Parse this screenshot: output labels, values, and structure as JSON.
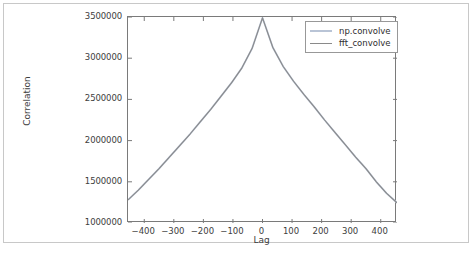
{
  "figure": {
    "background_color": "#ffffff",
    "frame_color": "#c8c8c8",
    "axes_edge_color": "#7a7a7a"
  },
  "legend": {
    "position": "upper right",
    "entries": [
      {
        "label": "np.convolve",
        "color": "#b9c4d6"
      },
      {
        "label": "fft_convolve",
        "color": "#8a8a8a"
      }
    ]
  },
  "chart_data": {
    "type": "line",
    "title": "",
    "xlabel": "Lag",
    "ylabel": "Correlation",
    "xlim": [
      -455,
      455
    ],
    "ylim": [
      1000000,
      3500000
    ],
    "grid": false,
    "legend_position": "upper right",
    "xticks": [
      -400,
      -300,
      -200,
      -100,
      0,
      100,
      200,
      300,
      400
    ],
    "xtick_labels": [
      "−400",
      "−300",
      "−200",
      "−100",
      "0",
      "100",
      "200",
      "300",
      "400"
    ],
    "yticks": [
      1000000,
      1500000,
      2000000,
      2500000,
      3000000,
      3500000
    ],
    "ytick_labels": [
      "1000000",
      "1500000",
      "2000000",
      "2500000",
      "3000000",
      "3500000"
    ],
    "x": [
      -455,
      -420,
      -385,
      -350,
      -315,
      -280,
      -245,
      -210,
      -175,
      -140,
      -105,
      -70,
      -35,
      0,
      35,
      70,
      105,
      140,
      175,
      210,
      245,
      280,
      315,
      350,
      385,
      420,
      455
    ],
    "series": [
      {
        "name": "np.convolve",
        "color": "#b9c4d6",
        "values": [
          1280000,
          1400000,
          1530000,
          1660000,
          1800000,
          1940000,
          2080000,
          2230000,
          2380000,
          2540000,
          2700000,
          2880000,
          3120000,
          3490000,
          3130000,
          2900000,
          2720000,
          2560000,
          2410000,
          2250000,
          2100000,
          1950000,
          1800000,
          1660000,
          1500000,
          1360000,
          1245000
        ]
      },
      {
        "name": "fft_convolve",
        "color": "#8a8a8a",
        "values": [
          1280000,
          1400000,
          1530000,
          1660000,
          1800000,
          1940000,
          2080000,
          2230000,
          2380000,
          2540000,
          2700000,
          2880000,
          3120000,
          3490000,
          3130000,
          2900000,
          2720000,
          2560000,
          2410000,
          2250000,
          2100000,
          1950000,
          1800000,
          1660000,
          1500000,
          1360000,
          1245000
        ]
      }
    ]
  }
}
